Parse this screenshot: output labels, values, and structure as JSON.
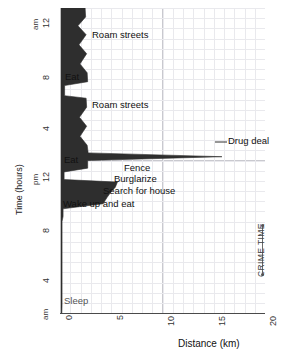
{
  "chart_data": {
    "type": "area",
    "title": "",
    "xlabel": "Distance (km)",
    "ylabel": "Time (hours)",
    "xlim": [
      0,
      20
    ],
    "ylim": [
      0,
      24
    ],
    "grid": true,
    "legend": "none",
    "orientation": "time-vertical-distance-horizontal",
    "xticks": [
      "0",
      "5",
      "10",
      "15",
      "20"
    ],
    "xtick_values": [
      0,
      5,
      10,
      15,
      20
    ],
    "yticks": [
      "12",
      "8",
      "4",
      "12",
      "8",
      "4",
      ""
    ],
    "ytick_values": [
      24,
      20,
      16,
      12,
      8,
      4,
      0
    ],
    "ytick_meridiem": [
      {
        "label": "am",
        "at": 24
      },
      {
        "label": "pm",
        "at": 12
      },
      {
        "label": "am",
        "at": 0
      }
    ],
    "series": [
      {
        "name": "Distance from home",
        "points": [
          {
            "time_hr": 24.0,
            "distance_km": 2.45
          },
          {
            "time_hr": 23.3,
            "distance_km": 2.5
          },
          {
            "time_hr": 22.6,
            "distance_km": 1.75
          },
          {
            "time_hr": 21.9,
            "distance_km": 2.55
          },
          {
            "time_hr": 21.1,
            "distance_km": 1.85
          },
          {
            "time_hr": 20.4,
            "distance_km": 2.6
          },
          {
            "time_hr": 19.6,
            "distance_km": 1.95
          },
          {
            "time_hr": 18.9,
            "distance_km": 2.65
          },
          {
            "time_hr": 18.2,
            "distance_km": 2.7
          },
          {
            "time_hr": 17.9,
            "distance_km": 0.45
          },
          {
            "time_hr": 17.1,
            "distance_km": 0.45
          },
          {
            "time_hr": 16.9,
            "distance_km": 2.55
          },
          {
            "time_hr": 16.2,
            "distance_km": 2.6
          },
          {
            "time_hr": 15.4,
            "distance_km": 1.9
          },
          {
            "time_hr": 14.7,
            "distance_km": 2.6
          },
          {
            "time_hr": 13.9,
            "distance_km": 1.95
          },
          {
            "time_hr": 13.2,
            "distance_km": 2.65
          },
          {
            "time_hr": 12.6,
            "distance_km": 2.75
          },
          {
            "time_hr": 12.3,
            "distance_km": 15.8
          },
          {
            "time_hr": 12.0,
            "distance_km": 2.7
          },
          {
            "time_hr": 11.4,
            "distance_km": 2.7
          },
          {
            "time_hr": 11.1,
            "distance_km": 0.4
          },
          {
            "time_hr": 10.5,
            "distance_km": 0.4
          },
          {
            "time_hr": 10.3,
            "distance_km": 5.6
          },
          {
            "time_hr": 9.9,
            "distance_km": 5.4
          },
          {
            "time_hr": 9.5,
            "distance_km": 4.95
          },
          {
            "time_hr": 9.1,
            "distance_km": 4.6
          },
          {
            "time_hr": 8.6,
            "distance_km": 4.2
          },
          {
            "time_hr": 8.2,
            "distance_km": 0.3
          },
          {
            "time_hr": 7.6,
            "distance_km": 0.3
          },
          {
            "time_hr": 7.2,
            "distance_km": 0.2
          },
          {
            "time_hr": 0.6,
            "distance_km": 0.2
          },
          {
            "time_hr": 0.0,
            "distance_km": 0.18
          }
        ]
      }
    ],
    "annotations": [
      {
        "text": "Roam streets",
        "time_hr": 22.1,
        "distance_km": 3.6
      },
      {
        "text": "Eat",
        "time_hr": 17.5,
        "distance_km": 0.9
      },
      {
        "text": "Roam streets",
        "time_hr": 15.2,
        "distance_km": 3.6
      },
      {
        "text": "Drug deal",
        "time_hr": 12.3,
        "distance_km": 16.4
      },
      {
        "text": "Eat",
        "time_hr": 10.8,
        "distance_km": 0.8
      },
      {
        "text": "Fence",
        "time_hr": 10.2,
        "distance_km": 6.3
      },
      {
        "text": "Burglarize",
        "time_hr": 9.4,
        "distance_km": 5.6
      },
      {
        "text": "Search for house",
        "time_hr": 8.6,
        "distance_km": 4.9
      },
      {
        "text": "Wake up and eat",
        "time_hr": 7.6,
        "distance_km": 0.6
      },
      {
        "text": "Sleep",
        "time_hr": 0.75,
        "distance_km": 0.6
      }
    ],
    "bracket_annotation": {
      "text": "CRIME TIME",
      "time_start_hr": 12.9,
      "time_end_hr": 8.9,
      "distance_km": 19.1
    }
  },
  "axes": {
    "x": {
      "label": "Distance (km)",
      "ticks": [
        {
          "label": "0",
          "value": 0
        },
        {
          "label": "5",
          "value": 5
        },
        {
          "label": "10",
          "value": 10
        },
        {
          "label": "15",
          "value": 15
        },
        {
          "label": "20",
          "value": 20
        }
      ]
    },
    "y": {
      "label": "Time (hours)",
      "ticks": [
        {
          "label": "12",
          "value": 24,
          "meridiem": "am"
        },
        {
          "label": "8",
          "value": 20,
          "meridiem": ""
        },
        {
          "label": "4",
          "value": 16,
          "meridiem": ""
        },
        {
          "label": "12",
          "value": 12,
          "meridiem": "pm"
        },
        {
          "label": "8",
          "value": 8,
          "meridiem": ""
        },
        {
          "label": "4",
          "value": 4,
          "meridiem": ""
        },
        {
          "label": "",
          "value": 0,
          "meridiem": "am"
        }
      ]
    }
  },
  "style": {
    "series_fill": "#2e2e2e",
    "grid_minor": "#e9e9ed",
    "grid_major": "#c9c9cf",
    "axis_color": "#4a4a4a",
    "text_color": "#111111",
    "sleep_text_color": "#555555",
    "bracket_color": "#6a6a6a"
  }
}
